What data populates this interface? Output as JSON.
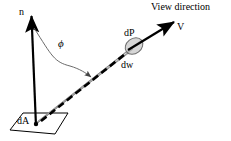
{
  "figure": {
    "background_color": "#ffffff",
    "stroke_color": "#000000",
    "beam_fill_color": "#d9d9d9",
    "beam_edge_color": "#808080",
    "ellipse_fill_color": "#cccccc",
    "arc_color": "#555555"
  },
  "labels": {
    "view_direction": "View direction",
    "v_vector": "V",
    "dp": "dP",
    "dw": "dw",
    "normal": "n",
    "phi": "ϕ",
    "da": "dA"
  },
  "geometry": {
    "normal_arrow": {
      "from_x": 36,
      "from_y": 124,
      "to_x": 31,
      "to_y": 14
    },
    "view_arrow": {
      "from_x": 130,
      "from_y": 48,
      "to_x": 176,
      "to_y": 21
    },
    "beam_apex": {
      "x": 36,
      "y": 124
    },
    "beam_end": {
      "x": 136,
      "y": 45
    },
    "solid_angle_ellipse": {
      "cx": 134,
      "cy": 46,
      "rx": 9,
      "ry": 7
    },
    "surface_patch": {
      "points": "10,130 23,113 68,113 55,134"
    },
    "phi_arc": {
      "start_x": 34,
      "start_y": 28,
      "end_x": 92,
      "end_y": 78
    }
  }
}
